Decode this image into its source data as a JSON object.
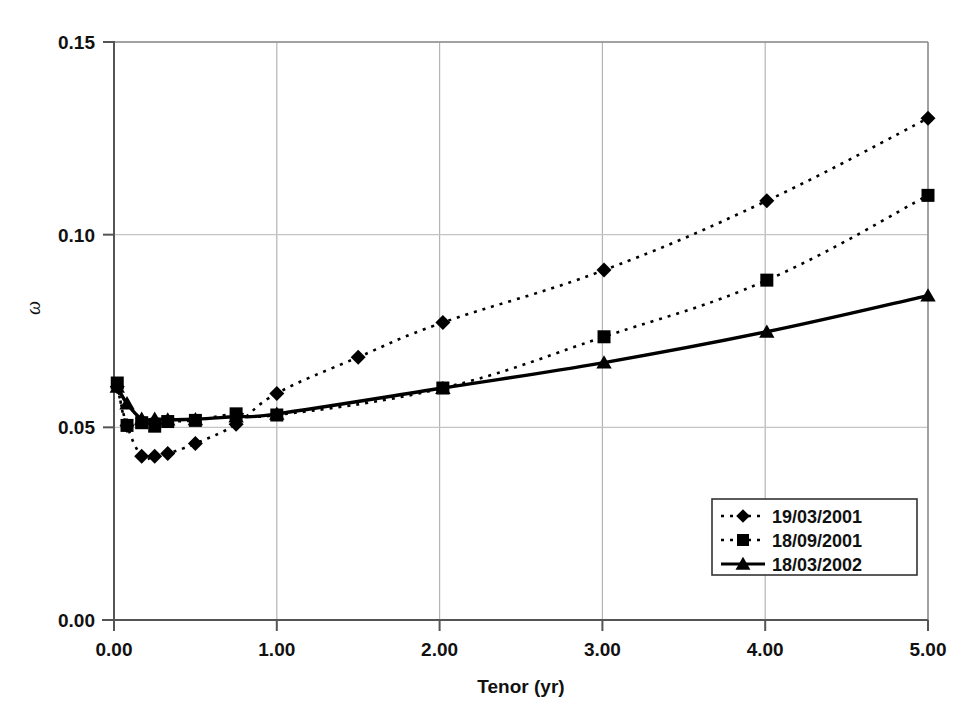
{
  "chart_data": {
    "type": "line",
    "title": "",
    "xlabel": "Tenor (yr)",
    "ylabel": "ω",
    "xlim": [
      0.0,
      5.0
    ],
    "ylim": [
      0.0,
      0.15
    ],
    "xticks": [
      "0.00",
      "1.00",
      "2.00",
      "3.00",
      "4.00",
      "5.00"
    ],
    "xtick_values": [
      0.0,
      1.0,
      2.0,
      3.0,
      4.0,
      5.0
    ],
    "yticks": [
      "0.00",
      "0.05",
      "0.10",
      "0.15"
    ],
    "ytick_values": [
      0.0,
      0.05,
      0.1,
      0.15
    ],
    "grid": "major-xy",
    "legend_position": "bottom-right",
    "series": [
      {
        "name": "19/03/2001",
        "marker": "diamond",
        "line_style": "dotted",
        "color": "#000000",
        "x": [
          0.02,
          0.08,
          0.17,
          0.25,
          0.33,
          0.5,
          0.75,
          1.0,
          1.5,
          2.02,
          3.01,
          4.01,
          5.0
        ],
        "y": [
          0.0605,
          0.0505,
          0.0425,
          0.0425,
          0.0432,
          0.0458,
          0.0508,
          0.0588,
          0.0682,
          0.0772,
          0.0908,
          0.1088,
          0.1302
        ]
      },
      {
        "name": "18/09/2001",
        "marker": "square",
        "line_style": "dotted",
        "color": "#000000",
        "x": [
          0.02,
          0.08,
          0.17,
          0.25,
          0.33,
          0.5,
          0.75,
          1.0,
          2.02,
          3.01,
          4.01,
          5.0
        ],
        "y": [
          0.0615,
          0.0505,
          0.0512,
          0.0503,
          0.0515,
          0.0518,
          0.0535,
          0.0532,
          0.0602,
          0.0735,
          0.0882,
          0.1102
        ]
      },
      {
        "name": "18/03/2002",
        "marker": "triangle",
        "line_style": "solid",
        "color": "#000000",
        "x": [
          0.02,
          0.08,
          0.17,
          0.25,
          0.33,
          0.5,
          0.75,
          1.0,
          2.02,
          3.01,
          4.01,
          5.0
        ],
        "y": [
          0.0605,
          0.0562,
          0.0522,
          0.0522,
          0.052,
          0.0521,
          0.0528,
          0.0535,
          0.0602,
          0.0668,
          0.0748,
          0.0842
        ]
      }
    ]
  },
  "legend": {
    "entries": [
      {
        "label": "19/03/2001",
        "marker": "diamond",
        "style": "dashed"
      },
      {
        "label": "18/09/2001",
        "marker": "square",
        "style": "dashed"
      },
      {
        "label": "18/03/2002",
        "marker": "triangle",
        "style": "solid"
      }
    ]
  },
  "caption": {
    "text": ""
  }
}
